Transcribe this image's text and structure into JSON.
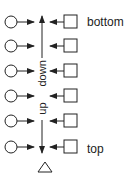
{
  "diagram": {
    "rows": 6,
    "labels": {
      "bottom": "bottom",
      "top": "top",
      "down": "down",
      "up": "up"
    },
    "colors": {
      "stroke": "#222222",
      "background": "#ffffff"
    },
    "shapes": {
      "left_node": "circle",
      "right_node": "square",
      "end_node": "triangle"
    }
  }
}
